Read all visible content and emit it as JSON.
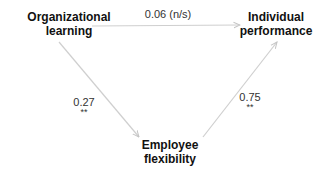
{
  "diagram": {
    "type": "path-model",
    "edge_color": "#c8c8c8",
    "text_color": "#111111",
    "nodes": {
      "organizational_learning": {
        "line1": "Organizational",
        "line2": "learning"
      },
      "individual_performance": {
        "line1": "Individual",
        "line2": "performance"
      },
      "employee_flexibility": {
        "line1": "Employee",
        "line2": "flexibility"
      }
    },
    "edges": {
      "ol_to_ip": {
        "from": "Organizational learning",
        "to": "Individual performance",
        "coefficient": "0.06 (n/s)",
        "significance": ""
      },
      "ol_to_ef": {
        "from": "Organizational learning",
        "to": "Employee flexibility",
        "coefficient": "0.27",
        "significance": "**"
      },
      "ef_to_ip": {
        "from": "Employee flexibility",
        "to": "Individual performance",
        "coefficient": "0.75",
        "significance": "**"
      }
    }
  }
}
